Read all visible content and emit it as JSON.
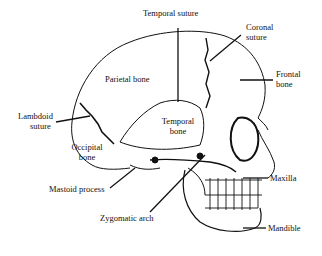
{
  "diagram": {
    "labels": {
      "temporal_suture": "Temporal suture",
      "coronal_suture_1": "Coronal",
      "coronal_suture_2": "suture",
      "frontal_bone_1": "Frontal",
      "frontal_bone_2": "bone",
      "parietal_bone": "Parietal bone",
      "lambdoid_suture_1": "Lambdoid",
      "lambdoid_suture_2": "suture",
      "temporal_bone_1": "Temporal",
      "temporal_bone_2": "bone",
      "occipital_bone_1": "Occipital",
      "occipital_bone_2": "bone",
      "mastoid_process": "Mastoid process",
      "zygomatic_arch": "Zygomatic arch",
      "maxilla": "Maxilla",
      "mandible": "Mandible"
    },
    "colors": {
      "ink": "#111111",
      "background": "#ffffff"
    }
  }
}
